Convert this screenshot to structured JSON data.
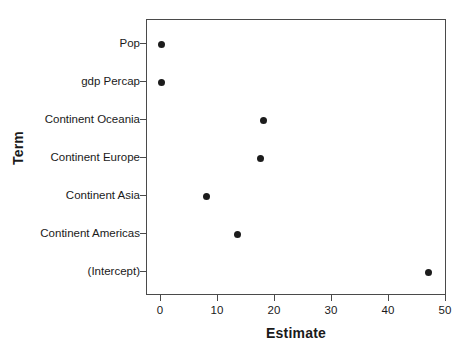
{
  "chart_data": {
    "type": "scatter",
    "title": "",
    "xlabel": "Estimate",
    "ylabel": "Term",
    "xlim": [
      0,
      50
    ],
    "xticks": [
      0,
      10,
      20,
      30,
      40,
      50
    ],
    "xticklabels": [
      "0",
      "10",
      "20",
      "30",
      "40",
      "50"
    ],
    "grid": false,
    "legend": null,
    "categories": [
      "Pop",
      "gdp Percap",
      "Continent Oceania",
      "Continent Europe",
      "Continent Asia",
      "Continent Americas",
      "(Intercept)"
    ],
    "points": [
      {
        "term": "Pop",
        "estimate": 0.0
      },
      {
        "term": "gdp Percap",
        "estimate": 0.0
      },
      {
        "term": "Continent Oceania",
        "estimate": 18.0
      },
      {
        "term": "Continent Europe",
        "estimate": 17.5
      },
      {
        "term": "Continent Asia",
        "estimate": 8.0
      },
      {
        "term": "Continent Americas",
        "estimate": 13.5
      },
      {
        "term": "(Intercept)",
        "estimate": 47.0
      }
    ],
    "marker": {
      "shape": "circle",
      "color": "#1c1c1c",
      "size": 7
    },
    "axis_color": "#4a4a4a",
    "background": "#ffffff"
  }
}
